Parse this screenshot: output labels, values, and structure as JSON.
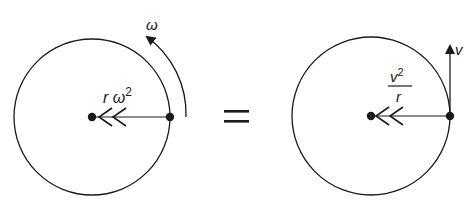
{
  "diagram": {
    "left_panel": {
      "angular_velocity_label": "ω",
      "acceleration_label_base": "r ω",
      "acceleration_label_exp": "2"
    },
    "operator": "=",
    "right_panel": {
      "velocity_label": "v",
      "fraction_numerator_base": "v",
      "fraction_numerator_exp": "2",
      "fraction_denominator": "r"
    },
    "colors": {
      "stroke": "#1a1a1a",
      "background": "#ffffff"
    }
  }
}
